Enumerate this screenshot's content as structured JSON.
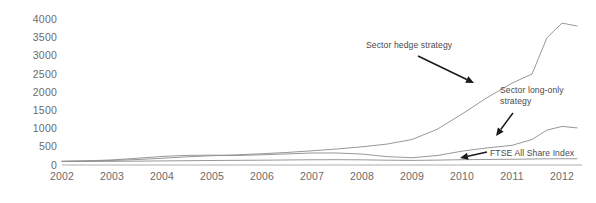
{
  "chart_data": {
    "type": "line",
    "title": "",
    "subtitle": "",
    "xlabel": "",
    "ylabel": "",
    "xlim": [
      2002,
      2012.4
    ],
    "ylim": [
      0,
      4150
    ],
    "grid": false,
    "legend_position": "none",
    "x_tick_labels": [
      "2002",
      "2003",
      "2004",
      "2005",
      "2006",
      "2007",
      "2008",
      "2009",
      "2010",
      "2011",
      "2012"
    ],
    "y_tick_labels": [
      "0",
      "500",
      "1000",
      "1500",
      "2000",
      "2500",
      "3000",
      "3500",
      "4000"
    ],
    "y_ticks": [
      0,
      500,
      1000,
      1500,
      2000,
      2500,
      3000,
      3500,
      4000
    ],
    "x": [
      2002.0,
      2002.5,
      2003.0,
      2003.5,
      2004.0,
      2004.5,
      2005.0,
      2005.5,
      2006.0,
      2006.5,
      2007.0,
      2007.5,
      2008.0,
      2008.5,
      2009.0,
      2009.5,
      2010.0,
      2010.5,
      2011.0,
      2011.4,
      2011.7,
      2012.0,
      2012.3
    ],
    "series": [
      {
        "name": "Sector hedge strategy",
        "color": "#8c8c8c",
        "values": [
          100,
          110,
          125,
          150,
          185,
          225,
          255,
          280,
          310,
          345,
          390,
          440,
          500,
          575,
          700,
          980,
          1400,
          1850,
          2250,
          2500,
          3500,
          3900,
          3820
        ]
      },
      {
        "name": "Sector long-only strategy",
        "color": "#8c8c8c",
        "values": [
          100,
          115,
          140,
          185,
          235,
          265,
          270,
          260,
          280,
          305,
          330,
          330,
          300,
          230,
          200,
          260,
          380,
          470,
          540,
          700,
          960,
          1060,
          1020
        ]
      },
      {
        "name": "FTSE All Share Index",
        "color": "#8c8c8c",
        "values": [
          100,
          100,
          102,
          106,
          112,
          118,
          124,
          128,
          132,
          138,
          144,
          146,
          142,
          132,
          126,
          134,
          146,
          152,
          158,
          164,
          170,
          172,
          170
        ]
      }
    ],
    "annotations": [
      {
        "name": "sector-hedge-strategy",
        "text": "Sector hedge strategy",
        "lines": [
          "Sector hedge strategy"
        ],
        "text_x": 366,
        "text_y": 48,
        "arrow_from_x": 418,
        "arrow_from_y": 56,
        "arrow_to_x": 474,
        "arrow_to_y": 83
      },
      {
        "name": "sector-long-only-strategy",
        "text": "Sector long-only strategy",
        "lines": [
          "Sector long-only",
          "strategy"
        ],
        "text_x": 500,
        "text_y": 93,
        "arrow_from_x": 513,
        "arrow_from_y": 113,
        "arrow_to_x": 496,
        "arrow_to_y": 136
      },
      {
        "name": "ftse-all-share-index",
        "text": "FTSE All Share Index",
        "lines": [
          "FTSE All Share Index"
        ],
        "text_x": 490,
        "text_y": 156,
        "arrow_from_x": 487,
        "arrow_from_y": 152,
        "arrow_to_x": 460,
        "arrow_to_y": 158
      }
    ]
  }
}
